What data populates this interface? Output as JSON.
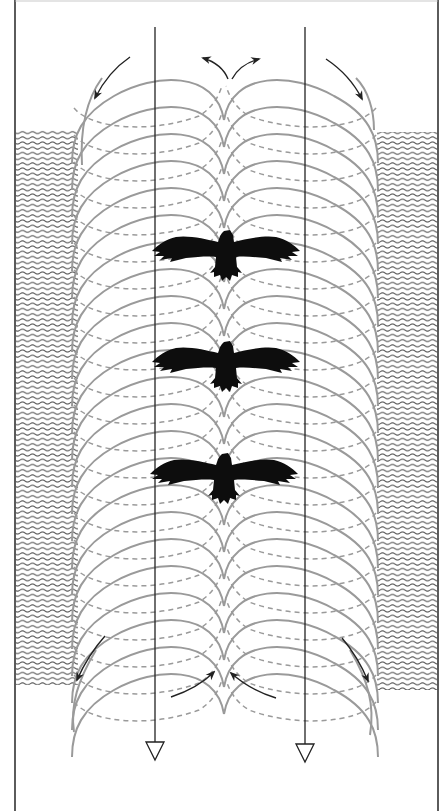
{
  "figure": {
    "width": 445,
    "height": 811,
    "background": "#ffffff",
    "frame": {
      "left_x": 15,
      "right_x": 438,
      "top_y": 0,
      "bottom_y": 811,
      "color": "#333333"
    }
  },
  "colors": {
    "vortex_line": "#9a9a9a",
    "ink": "#222222",
    "bird": "#0d0d0d",
    "water": "#555555"
  },
  "water_banks": [
    {
      "name": "left-water-bank",
      "x": 15,
      "y": 130,
      "width": 63,
      "height": 555
    },
    {
      "name": "right-water-bank",
      "x": 377,
      "y": 132,
      "width": 61,
      "height": 558
    }
  ],
  "vortex": {
    "center_x": 224,
    "left_outer_x": 72,
    "right_outer_x": 378,
    "first_loop_y": 78,
    "loop_spacing": 27,
    "loop_count": 23,
    "loop_height": 85
  },
  "flow_lines": [
    {
      "name": "left-downwash-line",
      "x": 155,
      "y_start": 27,
      "y_end": 760
    },
    {
      "name": "right-downwash-line",
      "x": 305,
      "y_start": 27,
      "y_end": 762
    }
  ],
  "flow_arrows": [
    {
      "name": "top-left-inflow-arrow",
      "path": "M130 57 Q108 72 95 98",
      "direction": "down-left"
    },
    {
      "name": "top-right-inflow-arrow",
      "path": "M326 59 Q350 75 362 99",
      "direction": "down-right"
    },
    {
      "name": "top-center-left-outflow-arrow",
      "path": "M228 79 Q222 64 203 58",
      "direction": "up-left"
    },
    {
      "name": "top-center-right-outflow-arrow",
      "path": "M232 79 Q240 64 259 59",
      "direction": "up-right"
    },
    {
      "name": "bottom-left-side-arrow",
      "path": "M105 636 Q88 655 77 680",
      "direction": "down-left"
    },
    {
      "name": "bottom-right-side-arrow",
      "path": "M342 638 Q358 657 368 681",
      "direction": "down-right"
    },
    {
      "name": "bottom-center-left-inflow-arrow",
      "path": "M171 697 Q198 688 214 672",
      "direction": "up-right"
    },
    {
      "name": "bottom-center-right-inflow-arrow",
      "path": "M276 698 Q250 690 231 673",
      "direction": "up-left"
    }
  ],
  "birds": [
    {
      "name": "bird-top",
      "cx": 226,
      "cy": 255,
      "span": 146
    },
    {
      "name": "bird-middle",
      "cx": 226,
      "cy": 366,
      "span": 146
    },
    {
      "name": "bird-bottom",
      "cx": 224,
      "cy": 478,
      "span": 146
    }
  ],
  "labels": {
    "description": "Downwash diagram: two downward arrows flank the vortex columns shed by three soaring birds"
  }
}
